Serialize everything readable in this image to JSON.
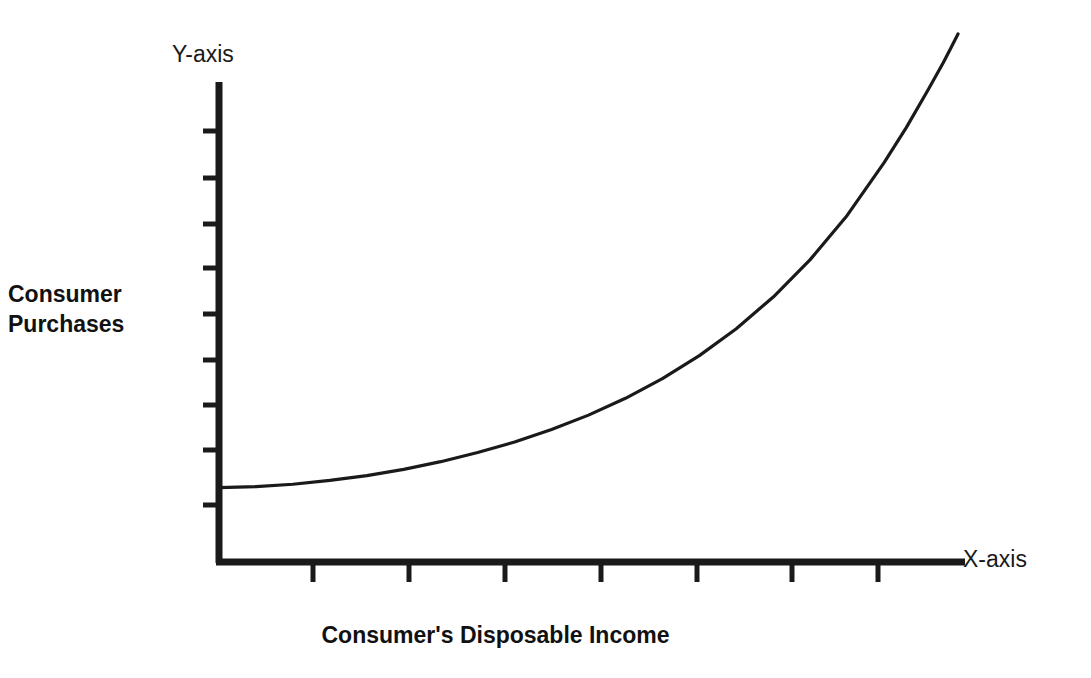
{
  "chart_data": {
    "type": "line",
    "title": "",
    "subtitle": "",
    "xlabel": "Consumer's Disposable Income",
    "ylabel": "Consumer\nPurchases",
    "x_axis_end_label": "X-axis",
    "y_axis_end_label": "Y-axis",
    "grid": false,
    "legend": null,
    "annotations": [],
    "xlim": [
      0,
      10
    ],
    "ylim": [
      0,
      10
    ],
    "x_tick_labels": [],
    "y_tick_labels": [],
    "x_tick_count": 7,
    "y_tick_count": 9,
    "series": [
      {
        "name": "Consumption function",
        "description": "Upward-sloping convex curve: consumer purchases rise slowly at low income then increase steeply at high income",
        "x": [
          0.0,
          0.5,
          1.0,
          1.5,
          2.0,
          2.5,
          3.0,
          3.5,
          4.0,
          4.5,
          5.0,
          5.5,
          6.0,
          6.5,
          7.0,
          7.5,
          8.0,
          8.5,
          9.0,
          9.3,
          9.6,
          9.8,
          9.9,
          10.0
        ],
        "y": [
          1.55,
          1.57,
          1.62,
          1.7,
          1.8,
          1.93,
          2.09,
          2.28,
          2.5,
          2.76,
          3.06,
          3.41,
          3.82,
          4.3,
          4.86,
          5.52,
          6.3,
          7.22,
          8.32,
          9.05,
          9.85,
          10.4,
          10.7,
          11.0
        ]
      }
    ],
    "colors": {
      "background": "#ffffff",
      "axis": "#1a1a1a",
      "curve": "#1a1a1a",
      "text": "#111111"
    }
  },
  "geometry": {
    "axis_origin_x": 219,
    "axis_origin_y": 562,
    "y_axis_top": 82,
    "x_axis_right": 965,
    "y_ticks": [
      131,
      178,
      224,
      268,
      314,
      360,
      405,
      450,
      505
    ],
    "x_ticks": [
      313,
      409,
      505,
      601,
      697,
      792,
      878
    ],
    "curve_points": "219,489 250,488 290,486 330,484 380,481 430,477 480,472 530,466 580,458 630,449 680,438 730,425 780,408 820,390 860,366 890,339 915,306 932,277 944,246 952,215 957,196 958,186"
  }
}
